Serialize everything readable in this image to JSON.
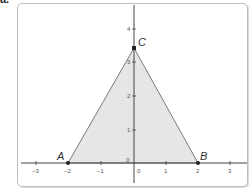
{
  "figure": {
    "part_label": "a.",
    "x_axis": {
      "ticks": [
        -3,
        -2,
        -1,
        0,
        1,
        2,
        3
      ],
      "tick_labels": [
        "−3",
        "−2",
        "−1",
        "0",
        "1",
        "2",
        "3"
      ]
    },
    "y_axis": {
      "ticks": [
        0,
        1,
        2,
        3,
        4
      ],
      "tick_labels": [
        "0",
        "1",
        "2",
        "3",
        "4"
      ]
    },
    "triangle": {
      "fill": "#e6e6e6",
      "stroke": "#7a7a7a",
      "vertices": [
        {
          "label": "A",
          "x": -2,
          "y": 0
        },
        {
          "label": "B",
          "x": 2,
          "y": 0
        },
        {
          "label": "C",
          "x": 0,
          "y": 3.46
        }
      ]
    },
    "axis_color": "#444444"
  }
}
